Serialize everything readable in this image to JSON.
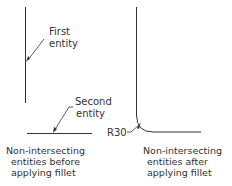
{
  "left_figure": {
    "label_first": [
      "First",
      "entity"
    ],
    "label_second": [
      "Second",
      "entity"
    ],
    "caption": [
      "Non-intersecting",
      "entities before",
      "applying fillet"
    ]
  },
  "right_figure": {
    "radius_label": "R30",
    "caption": [
      "Non-intersecting",
      "entities after",
      "applying fillet"
    ]
  },
  "colors": {
    "line": "#333333",
    "background": "#ffffff"
  }
}
